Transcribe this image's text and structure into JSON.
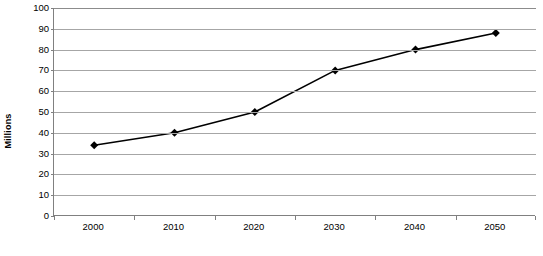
{
  "chart_data": {
    "type": "line",
    "title": "",
    "subtitle": "",
    "xlabel": "",
    "ylabel": "Millions",
    "categories": [
      "2000",
      "2010",
      "2020",
      "2030",
      "2040",
      "2050"
    ],
    "values": [
      34,
      40,
      50,
      70,
      80,
      88
    ],
    "series": [
      {
        "name": "",
        "values": [
          34,
          40,
          50,
          70,
          80,
          88
        ]
      }
    ],
    "ylim": [
      0,
      100
    ],
    "ytick_step": 10,
    "yticks": [
      100,
      90,
      80,
      70,
      60,
      50,
      40,
      30,
      20,
      10,
      0
    ],
    "ytick_labels": [
      "100",
      "90",
      "80",
      "70",
      "60",
      "50",
      "40",
      "30",
      "20",
      "10",
      "0"
    ],
    "grid": "horizontal",
    "legend": "none",
    "marker": "diamond",
    "line_color": "#000000",
    "marker_color": "#000000",
    "grid_color": "#a6a6a6",
    "axis_color": "#808080",
    "plot_background": "#ffffff"
  },
  "caption": {
    "text": ""
  }
}
